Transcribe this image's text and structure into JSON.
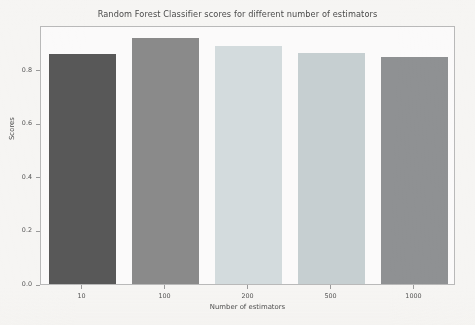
{
  "chart_data": {
    "type": "bar",
    "title": "Random Forest Classifier scores for different number of estimators",
    "xlabel": "Number of estimators",
    "ylabel": "Scores",
    "categories": [
      "10",
      "100",
      "200",
      "500",
      "1000"
    ],
    "values": [
      0.86,
      0.92,
      0.89,
      0.864,
      0.849
    ],
    "bar_colors": [
      "#585858",
      "#8a8a8a",
      "#d3dbdd",
      "#c6cfd1",
      "#8f9193"
    ],
    "ylim": [
      0.0,
      0.968
    ],
    "yticks": [
      "0.0",
      "0.2",
      "0.4",
      "0.6",
      "0.8"
    ],
    "ytick_values": [
      0.0,
      0.2,
      0.4,
      0.6,
      0.8
    ],
    "grid": false,
    "legend": "none",
    "background_color": "#f6f5f3",
    "axes_background_color": "#fbfafa",
    "frame_color": "#b9b9b9"
  }
}
